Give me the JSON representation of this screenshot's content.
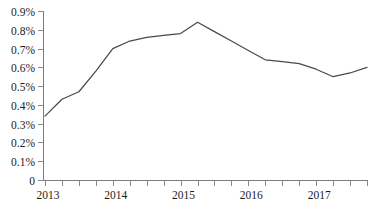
{
  "chart_data": {
    "type": "line",
    "title": "",
    "xlabel": "",
    "ylabel": "",
    "grid": false,
    "legend": false,
    "ylim": [
      0,
      0.9
    ],
    "y_tick_labels": [
      "0",
      "0.1%",
      "0.2%",
      "0.3%",
      "0.4%",
      "0.5%",
      "0.6%",
      "0.7%",
      "0.8%",
      "0.9%"
    ],
    "y_tick_values": [
      0,
      0.1,
      0.2,
      0.3,
      0.4,
      0.5,
      0.6,
      0.7,
      0.8,
      0.9
    ],
    "x_tick_labels": [
      "2013",
      "",
      "",
      "",
      "2014",
      "",
      "",
      "",
      "2015",
      "",
      "",
      "",
      "2016",
      "",
      "",
      "",
      "2017",
      "",
      "",
      ""
    ],
    "x_axis_labels": [
      "2013",
      "2014",
      "2015",
      "2016",
      "2017"
    ],
    "x": [
      "2013 Q1",
      "2013 Q2",
      "2013 Q3",
      "2013 Q4",
      "2014 Q1",
      "2014 Q2",
      "2014 Q3",
      "2014 Q4",
      "2015 Q1",
      "2015 Q2",
      "2015 Q3",
      "2015 Q4",
      "2016 Q1",
      "2016 Q2",
      "2016 Q3",
      "2016 Q4",
      "2017 Q1",
      "2017 Q2",
      "2017 Q3",
      "2017 Q4"
    ],
    "values": [
      0.34,
      0.43,
      0.47,
      0.58,
      0.7,
      0.74,
      0.76,
      0.77,
      0.78,
      0.84,
      0.79,
      0.74,
      0.69,
      0.64,
      0.63,
      0.62,
      0.59,
      0.55,
      0.57,
      0.6
    ],
    "series": [
      {
        "name": "series-1",
        "color": "#4a4a4a",
        "values": [
          0.34,
          0.43,
          0.47,
          0.58,
          0.7,
          0.74,
          0.76,
          0.77,
          0.78,
          0.84,
          0.79,
          0.74,
          0.69,
          0.64,
          0.63,
          0.62,
          0.59,
          0.55,
          0.57,
          0.6
        ]
      }
    ]
  },
  "colors": {
    "line": "#4a4a4a",
    "axis": "#7a7a7a",
    "text": "#1c1c1c",
    "background": "#ffffff"
  }
}
